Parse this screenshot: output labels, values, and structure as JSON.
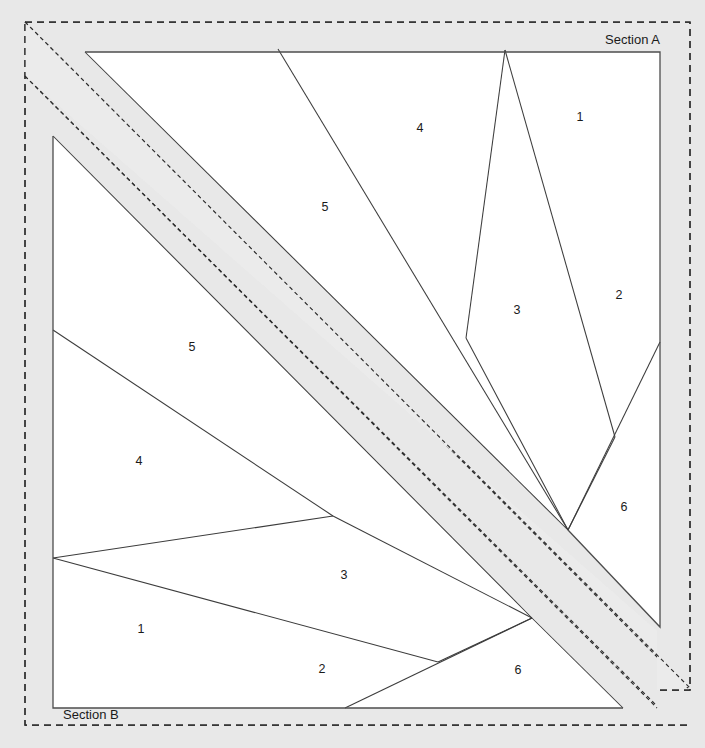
{
  "canvas": {
    "width": 705,
    "height": 748,
    "background_color": "#e8e8e8",
    "panel_fill_color": "#ffffff",
    "band_fill_color": "#ebebeb",
    "line_color": "#3c3c3c"
  },
  "sections": [
    {
      "id": "A",
      "label": "Section A",
      "label_position": "top-right",
      "label_x": 660,
      "label_y": 44,
      "panel": {
        "outline": "85,52 660,52 660,342 660,627 568,530",
        "corners": [
          {
            "x": 85,
            "y": 52
          },
          {
            "x": 660,
            "y": 52
          },
          {
            "x": 660,
            "y": 342
          },
          {
            "x": 660,
            "y": 627
          },
          {
            "x": 568,
            "y": 530
          }
        ]
      },
      "fan_origin": {
        "x": 568,
        "y": 530
      },
      "regions": [
        {
          "number": "1",
          "label_x": 580,
          "label_y": 118
        },
        {
          "number": "2",
          "label_x": 619,
          "label_y": 296
        },
        {
          "number": "3",
          "label_x": 517,
          "label_y": 311
        },
        {
          "number": "4",
          "label_x": 420,
          "label_y": 129
        },
        {
          "number": "5",
          "label_x": 325,
          "label_y": 208
        },
        {
          "number": "6",
          "label_x": 624,
          "label_y": 508
        }
      ]
    },
    {
      "id": "B",
      "label": "Section B",
      "label_position": "bottom-left",
      "label_x": 63,
      "label_y": 719,
      "panel": {
        "outline": "53,136 53,330 53,558 53,708 345,708 623,708",
        "corners": [
          {
            "x": 53,
            "y": 136
          },
          {
            "x": 53,
            "y": 330
          },
          {
            "x": 53,
            "y": 558
          },
          {
            "x": 53,
            "y": 708
          },
          {
            "x": 623,
            "y": 708
          }
        ]
      },
      "fan_origin": {
        "x": 532,
        "y": 618
      },
      "regions": [
        {
          "number": "1",
          "label_x": 141,
          "label_y": 630
        },
        {
          "number": "2",
          "label_x": 322,
          "label_y": 670
        },
        {
          "number": "3",
          "label_x": 344,
          "label_y": 576
        },
        {
          "number": "4",
          "label_x": 139,
          "label_y": 462
        },
        {
          "number": "5",
          "label_x": 192,
          "label_y": 348
        },
        {
          "number": "6",
          "label_x": 518,
          "label_y": 671
        }
      ]
    }
  ],
  "outer_boundaries": [
    {
      "name": "section-a-dashed-outline",
      "points": "25,22 690,22 690,690 657,690 657,631"
    },
    {
      "name": "section-b-dashed-outline",
      "points": "25,76 25,725 688,725"
    }
  ],
  "diagonal_band": {
    "name": "diagonal-separator-band",
    "fill": "#ebebeb",
    "angle_degrees": 45,
    "upper_edge": "25,22 690,690",
    "lower_edge": "25,76 660,711"
  }
}
